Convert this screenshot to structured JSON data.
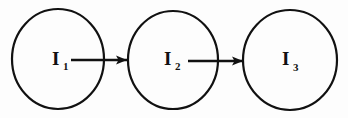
{
  "diagram": {
    "type": "flow-chain",
    "background_color": "#fdfdfd",
    "stroke_color": "#111111",
    "nodes": [
      {
        "id": "node-1",
        "label_base": "I",
        "label_sub": "1",
        "label_full": "I1",
        "shape": "ellipse",
        "cx": 58,
        "cy": 59,
        "rx": 46,
        "ry": 50,
        "stroke_width": 2.2,
        "label_x": 52,
        "label_y": 65,
        "sub_x": 63,
        "sub_y": 70
      },
      {
        "id": "node-2",
        "label_base": "I",
        "label_sub": "2",
        "label_full": "I2",
        "shape": "ellipse",
        "cx": 173,
        "cy": 60,
        "rx": 45,
        "ry": 49,
        "stroke_width": 2.2,
        "label_x": 164,
        "label_y": 65,
        "sub_x": 175,
        "sub_y": 70
      },
      {
        "id": "node-3",
        "label_base": "I",
        "label_sub": "3",
        "label_full": "I3",
        "shape": "ellipse",
        "cx": 290,
        "cy": 60,
        "rx": 47,
        "ry": 50,
        "stroke_width": 2.2,
        "label_x": 282,
        "label_y": 65,
        "sub_x": 293,
        "sub_y": 71
      }
    ],
    "arrows": [
      {
        "id": "arrow-1",
        "from": "node-1",
        "to": "node-2",
        "x1": 71,
        "x2": 127,
        "y": 60,
        "head_width": 11,
        "head_height": 9
      },
      {
        "id": "arrow-2",
        "from": "node-2",
        "to": "node-3",
        "x1": 188,
        "x2": 243,
        "y": 61,
        "head_width": 11,
        "head_height": 9
      }
    ]
  }
}
